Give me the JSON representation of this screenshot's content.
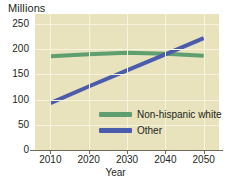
{
  "chart_data": {
    "type": "line",
    "title": "",
    "ylabel": "Millions",
    "xlabel": "Year",
    "x": [
      2010,
      2020,
      2030,
      2040,
      2050
    ],
    "xlim": [
      2006,
      2054
    ],
    "ylim": [
      0,
      270
    ],
    "yticks": [
      0,
      50,
      100,
      150,
      200,
      250
    ],
    "xticks": [
      2010,
      2020,
      2030,
      2040,
      2050
    ],
    "grid": true,
    "legend_position": "center-right-inside",
    "series": [
      {
        "name": "Non-hispanic white",
        "color": "#5f9e6e",
        "values": [
          186,
          190,
          193,
          191,
          187
        ]
      },
      {
        "name": "Other",
        "color": "#4a5cab",
        "values": [
          93,
          126,
          158,
          190,
          222
        ]
      }
    ]
  },
  "axes": {
    "y_unit_title": "Millions",
    "x_axis_title": "Year",
    "y_tick_labels": [
      "250",
      "200",
      "150",
      "100",
      "50",
      "0"
    ],
    "x_tick_labels": [
      "2010",
      "2020",
      "2030",
      "2040",
      "2050"
    ]
  },
  "legend": {
    "items": [
      {
        "label": "Non-hispanic white",
        "color": "#5f9e6e"
      },
      {
        "label": "Other",
        "color": "#4a5cab"
      }
    ]
  },
  "colors": {
    "plot_background": "#e8e3bd",
    "gridline": "#f6f3de",
    "axis": "#6f6a55",
    "text": "#231f20",
    "series_green": "#5f9e6e",
    "series_blue": "#4a5cab"
  }
}
